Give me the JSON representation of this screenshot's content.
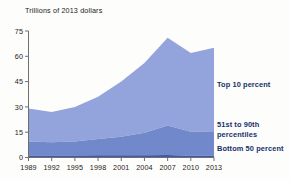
{
  "chart_data": {
    "type": "area",
    "title": "Trillions of 2013 dollars",
    "subtitle": "",
    "xlabel": "",
    "ylabel": "Trillions of 2013 dollars",
    "stacked": true,
    "grid": false,
    "legend_position": "right-inline",
    "xlim": [
      1989,
      2013
    ],
    "ylim": [
      0,
      75
    ],
    "yticks": [
      0,
      15,
      30,
      45,
      60,
      75
    ],
    "ytick_labels": [
      "0",
      "15",
      "30",
      "45",
      "60",
      "75"
    ],
    "xticks": [
      1989,
      1992,
      1995,
      1998,
      2001,
      2004,
      2007,
      2010,
      2013
    ],
    "xtick_labels": [
      "1989",
      "1992",
      "1995",
      "1998",
      "2001",
      "2004",
      "2007",
      "2010",
      "2013"
    ],
    "x": [
      1989,
      1992,
      1995,
      1998,
      2001,
      2004,
      2007,
      2010,
      2013
    ],
    "series": [
      {
        "name": "Bottom 50 percent",
        "color": "#4257ad",
        "values": [
          1.2,
          1.2,
          1.2,
          1.3,
          1.3,
          1.4,
          1.5,
          1.1,
          1.1
        ]
      },
      {
        "name": "51st to 90th percentiles",
        "color": "#7188ca",
        "values": [
          8.3,
          7.8,
          8.3,
          9.7,
          11.0,
          13.2,
          17.5,
          14.2,
          14.4
        ]
      },
      {
        "name": "Top 10 percent",
        "color": "#93a4dc",
        "values": [
          19.5,
          18.0,
          20.5,
          25.0,
          32.7,
          41.4,
          52.0,
          46.7,
          49.5
        ]
      }
    ],
    "stack_tops": {
      "bottom_50": [
        1.2,
        1.2,
        1.2,
        1.3,
        1.3,
        1.4,
        1.5,
        1.1,
        1.1
      ],
      "through_90th": [
        9.5,
        9.0,
        9.5,
        11.0,
        12.3,
        14.6,
        19.0,
        15.3,
        15.5
      ],
      "total": [
        29.0,
        27.0,
        30.0,
        36.0,
        45.0,
        56.0,
        71.0,
        62.0,
        65.0
      ]
    },
    "annotations": [
      {
        "text": "Top 10 percent",
        "series": "Top 10 percent"
      },
      {
        "text": "51st to 90th",
        "series": "51st to 90th percentiles"
      },
      {
        "text": "percentiles",
        "series": "51st to 90th percentiles"
      },
      {
        "text": "Bottom 50 percent",
        "series": "Bottom 50 percent"
      }
    ]
  },
  "labels": {
    "top10": "Top 10 percent",
    "mid_line1": "51st to 90th",
    "mid_line2": "percentiles",
    "bottom50": "Bottom 50 percent"
  },
  "colors": {
    "top10": "#93a4dc",
    "mid": "#7188ca",
    "bottom": "#4257ad",
    "axis": "#6f6f6f",
    "text": "#1b1b1b",
    "label_text": "#17306b",
    "background": "#fdfdfb"
  }
}
